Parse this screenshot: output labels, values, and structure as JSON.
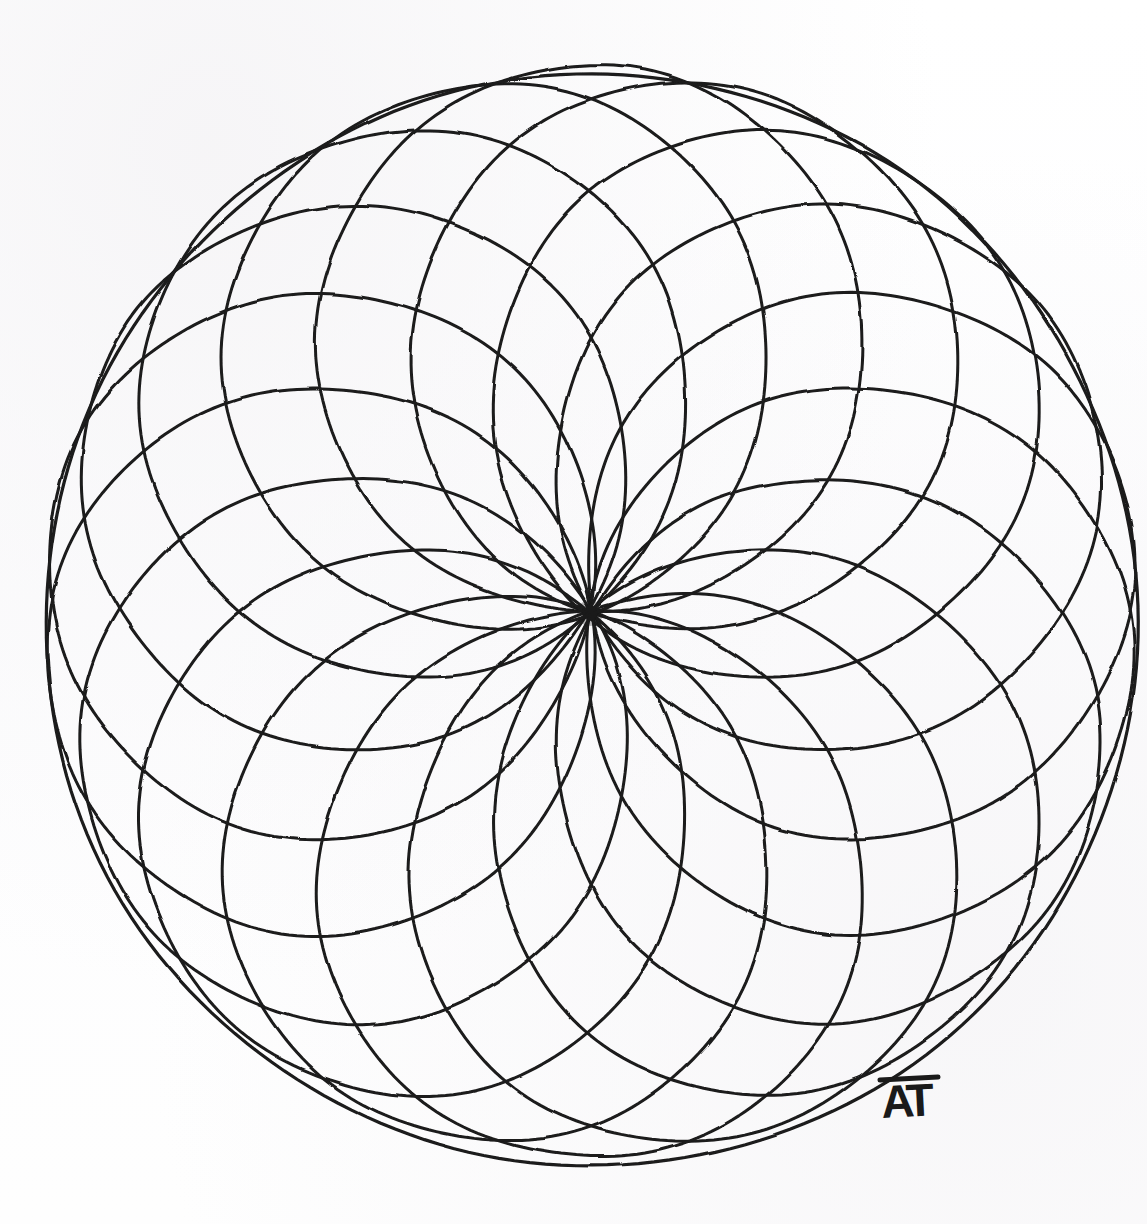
{
  "artwork": {
    "title": "Rose Window Mandala",
    "medium": "ink on paper",
    "background_color": "#fefefe",
    "ink_color": "#1a1a1a",
    "signature": "AT"
  },
  "canvas": {
    "width": 1147,
    "height": 1224
  },
  "chart_data": {
    "type": "scatter",
    "subtitle": "Concentric circle rosette — 18 equal circles through a common point",
    "xlabel": "",
    "ylabel": "",
    "grid": false,
    "legend_position": "none",
    "geometry": {
      "pattern_name": "circle rosette / torus knot grid",
      "circle_count": 18,
      "angular_step_degrees": 20,
      "center_point": {
        "x": 590,
        "y": 613
      },
      "envelope_center": {
        "x": 592,
        "y": 621
      },
      "envelope_radius": 546,
      "circle_radius": 273,
      "circle_center_orbit_radius": 273,
      "radiating_spokes_at_center": 36,
      "stroke_width": 3.0,
      "envelope_stroke_width": 3.2
    },
    "circle_centers_polar": [
      {
        "index": 1,
        "angle_deg": 0,
        "radius": 273
      },
      {
        "index": 2,
        "angle_deg": 20,
        "radius": 273
      },
      {
        "index": 3,
        "angle_deg": 40,
        "radius": 273
      },
      {
        "index": 4,
        "angle_deg": 60,
        "radius": 273
      },
      {
        "index": 5,
        "angle_deg": 80,
        "radius": 273
      },
      {
        "index": 6,
        "angle_deg": 100,
        "radius": 273
      },
      {
        "index": 7,
        "angle_deg": 120,
        "radius": 273
      },
      {
        "index": 8,
        "angle_deg": 140,
        "radius": 273
      },
      {
        "index": 9,
        "angle_deg": 160,
        "radius": 273
      },
      {
        "index": 10,
        "angle_deg": 180,
        "radius": 273
      },
      {
        "index": 11,
        "angle_deg": 200,
        "radius": 273
      },
      {
        "index": 12,
        "angle_deg": 220,
        "radius": 273
      },
      {
        "index": 13,
        "angle_deg": 240,
        "radius": 273
      },
      {
        "index": 14,
        "angle_deg": 260,
        "radius": 273
      },
      {
        "index": 15,
        "angle_deg": 280,
        "radius": 273
      },
      {
        "index": 16,
        "angle_deg": 300,
        "radius": 273
      },
      {
        "index": 17,
        "angle_deg": 320,
        "radius": 273
      },
      {
        "index": 18,
        "angle_deg": 340,
        "radius": 273
      }
    ],
    "envelope_tangent_points_deg": [
      0,
      20,
      40,
      60,
      80,
      100,
      120,
      140,
      160,
      180,
      200,
      220,
      240,
      260,
      280,
      300,
      320,
      340
    ]
  },
  "signature_block": {
    "text": "AT",
    "x": 882,
    "y": 1118
  }
}
